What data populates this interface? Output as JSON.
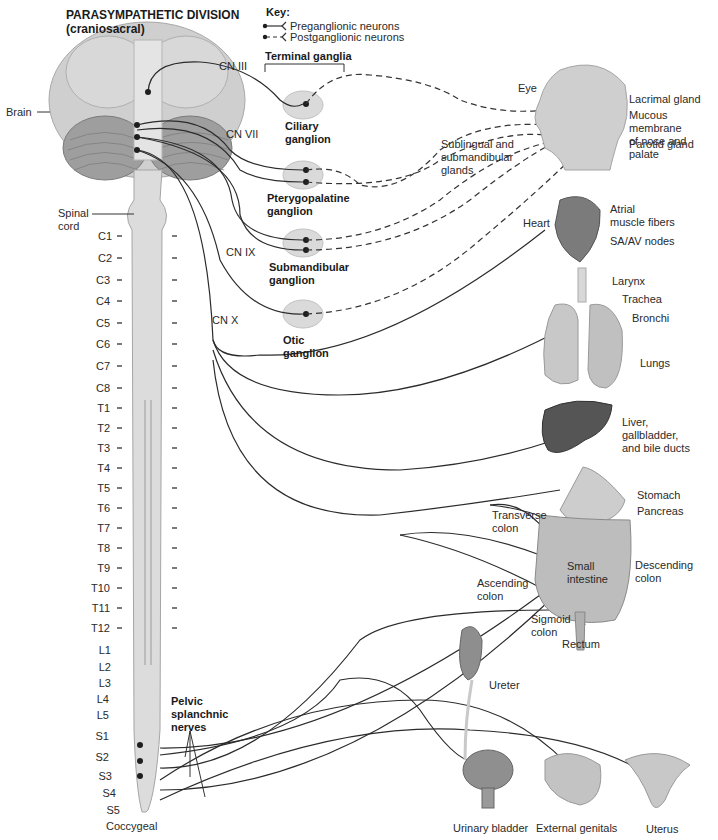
{
  "title": "PARASYMPATHETIC DIVISION\n(craniosacral)",
  "key": {
    "heading": "Key:",
    "items": [
      {
        "label": "Preganglionic neurons",
        "style": "solid"
      },
      {
        "label": "Postganglionic neurons",
        "style": "dashed"
      }
    ]
  },
  "terminal_ganglia_label": "Terminal ganglia",
  "structures": {
    "brain": "Brain",
    "spinal_cord": "Spinal\ncord"
  },
  "cranial_nerves": [
    "CN III",
    "CN VII",
    "CN IX",
    "CN X"
  ],
  "ganglia": [
    {
      "name": "Ciliary\nganglion"
    },
    {
      "name": "Pterygopalatine\nganglion"
    },
    {
      "name": "Submandibular\nganglion"
    },
    {
      "name": "Otic\nganglion"
    }
  ],
  "spinal_segments": [
    "C1",
    "C2",
    "C3",
    "C4",
    "C5",
    "C6",
    "C7",
    "C8",
    "T1",
    "T2",
    "T3",
    "T4",
    "T5",
    "T6",
    "T7",
    "T8",
    "T9",
    "T10",
    "T11",
    "T12",
    "L1",
    "L2",
    "L3",
    "L4",
    "L5",
    "S1",
    "S2",
    "S3",
    "S4",
    "S5",
    "Coccygeal"
  ],
  "pelvic_nerves_label": "Pelvic\nsplanchnic\nnerves",
  "targets": {
    "eye": "Eye",
    "lacrimal": "Lacrimal gland",
    "mucous": "Mucous membrane\nof nose and palate",
    "parotid": "Parotid gland",
    "sublingual": "Sublingual and\nsubmandibular\nglands",
    "heart": "Heart",
    "atrial": "Atrial\nmuscle fibers",
    "sa_av": "SA/AV nodes",
    "larynx": "Larynx",
    "trachea": "Trachea",
    "bronchi": "Bronchi",
    "lungs": "Lungs",
    "liver": "Liver,\ngallbladder,\nand bile ducts",
    "stomach": "Stomach",
    "pancreas": "Pancreas",
    "transverse_colon": "Transverse\ncolon",
    "small_intestine": "Small\nintestine",
    "descending_colon": "Descending\ncolon",
    "ascending_colon": "Ascending\ncolon",
    "sigmoid_colon": "Sigmoid\ncolon",
    "rectum": "Rectum",
    "ureter": "Ureter",
    "urinary_bladder": "Urinary bladder",
    "external_genitals": "External genitals",
    "uterus": "Uterus"
  },
  "colors": {
    "nerve": "#2b2b2b",
    "ganglion_fill": "#d9d9d9",
    "brain_fill": "#c8c8c8",
    "cord_fill": "#dcdcdc",
    "organ_dark": "#555555",
    "organ_light": "#c4c4c4"
  }
}
